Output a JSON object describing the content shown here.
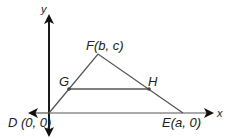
{
  "diagram": {
    "type": "coordinate-geometry",
    "axes": {
      "x_label": "x",
      "y_label": "y"
    },
    "points": {
      "D": {
        "label": "D (0, 0)",
        "x": 49,
        "y": 113
      },
      "E": {
        "label": "E(a, 0)",
        "x": 183,
        "y": 113
      },
      "F": {
        "label": "F(b, c)",
        "x": 98,
        "y": 54
      },
      "G": {
        "label": "G",
        "x": 69,
        "y": 89
      },
      "H": {
        "label": "H",
        "x": 149,
        "y": 89
      }
    },
    "segments": [
      {
        "from": "D",
        "to": "F"
      },
      {
        "from": "F",
        "to": "E"
      },
      {
        "from": "D",
        "to": "E"
      },
      {
        "from": "G",
        "to": "H"
      }
    ],
    "colors": {
      "axis": "#111111",
      "lines": "#555555",
      "text": "#222222"
    }
  }
}
